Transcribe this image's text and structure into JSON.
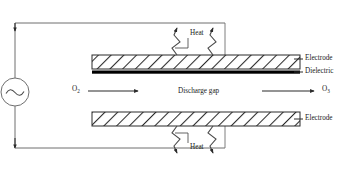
{
  "diagram": {
    "labels": {
      "heat_top": "Heat",
      "heat_bottom": "Heat",
      "electrode_top": "Electrode",
      "dielectric": "Dielectric",
      "electrode_bottom": "Electrode",
      "discharge_gap": "Discharge gap",
      "gas_in": "O",
      "gas_in_sub": "2",
      "gas_out": "O",
      "gas_out_sub": "3"
    },
    "icons": {
      "ac_source": "ac-source-icon",
      "heat_arrow": "wavy-arrow-icon",
      "flow_arrow": "straight-arrow-icon"
    },
    "colors": {
      "line": "#3a3a3a",
      "hatch": "#2b2b2b",
      "dielectric_fill": "#000000",
      "background": "#ffffff",
      "text": "#1a1a1a"
    },
    "geometry": {
      "electrode_left_x": 92,
      "electrode_right_x": 300,
      "top_electrode_y": 55,
      "bottom_electrode_y": 112,
      "top_wire_y": 23,
      "bottom_wire_y": 148,
      "source_cx": 24,
      "source_cy": 92,
      "source_r": 14
    }
  }
}
